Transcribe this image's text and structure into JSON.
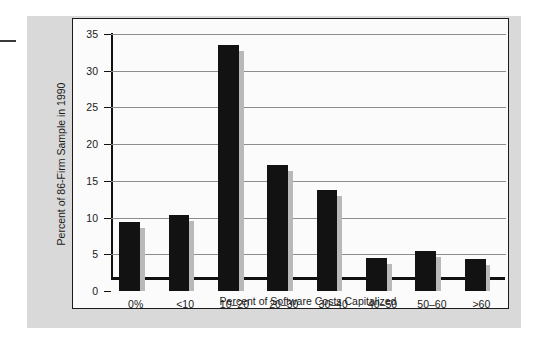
{
  "chart_data": {
    "type": "bar",
    "title": "",
    "subtitle": "",
    "xlabel": "Percent of Software Costs Capitalized",
    "ylabel": "Percent of 86-Firm Sample in 1990",
    "categories": [
      "0%",
      "<10",
      "10–20",
      "20–30",
      "30–40",
      "40–50",
      "50–60",
      ">60"
    ],
    "values": [
      9.4,
      10.3,
      33.5,
      17.2,
      13.8,
      4.5,
      5.5,
      4.4
    ],
    "series": [
      {
        "name": "Percent of 86-Firm Sample in 1990",
        "values": [
          9.4,
          10.3,
          33.5,
          17.2,
          13.8,
          4.5,
          5.5,
          4.4
        ]
      }
    ],
    "ylim": [
      0,
      35
    ],
    "ytick_labels": [
      "0",
      "5",
      "10",
      "15",
      "20",
      "25",
      "30",
      "35"
    ],
    "ytick_values": [
      0,
      5,
      10,
      15,
      20,
      25,
      30,
      35
    ],
    "grid": "horizontal",
    "legend": "none",
    "bar_color": "#121212",
    "bar_shadow_color": "#b9b9b9",
    "gridline_color": "#8d8d8d",
    "axis_color": "#111111",
    "plot_background": "#fbfbfb",
    "figure_background": "#d9d9d9"
  }
}
